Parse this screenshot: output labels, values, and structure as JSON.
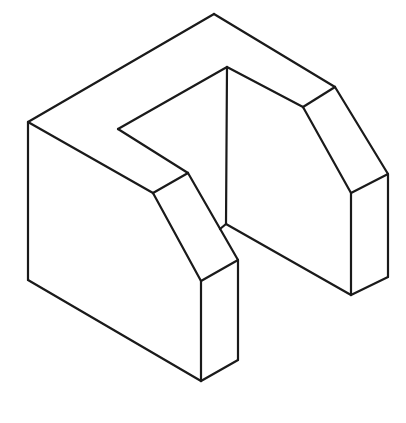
{
  "figure": {
    "title": "",
    "stroke_color": "#1a1a1a",
    "background_color": "#ffffff",
    "width": 406,
    "height": 423
  },
  "edges": [
    {
      "name": "top-left-edge",
      "points": "28,122 214,14"
    },
    {
      "name": "top-right-edge",
      "points": "214,14 335,87"
    },
    {
      "name": "left-vertical-edge",
      "points": "28,122 28,280"
    },
    {
      "name": "left-bottom-edge",
      "points": "28,280 201,381"
    },
    {
      "name": "left-top-front-edge",
      "points": "28,122 153,193"
    },
    {
      "name": "left-chamfer-top",
      "points": "153,193 188,173"
    },
    {
      "name": "left-chamfer-outer",
      "points": "153,193 201,281"
    },
    {
      "name": "left-chamfer-inner",
      "points": "188,173 238,260"
    },
    {
      "name": "left-post-top",
      "points": "201,281 238,260"
    },
    {
      "name": "left-post-front-vertical",
      "points": "201,281 201,381"
    },
    {
      "name": "left-post-right-vertical",
      "points": "238,260 238,360"
    },
    {
      "name": "left-post-bottom",
      "points": "201,381 238,360"
    },
    {
      "name": "notch-front-edge",
      "points": "188,173 118,129"
    },
    {
      "name": "notch-back-edge",
      "points": "118,129 227,67"
    },
    {
      "name": "slot-back-vertical",
      "points": "227,67 226,224"
    },
    {
      "name": "slot-floor-junction",
      "points": "220,229 226,224"
    },
    {
      "name": "slot-right-top-edge",
      "points": "227,67 303,107"
    },
    {
      "name": "slot-floor-right",
      "points": "226,224 351,295"
    },
    {
      "name": "right-chamfer-top",
      "points": "303,107 335,87"
    },
    {
      "name": "right-chamfer-inner",
      "points": "303,107 351,193"
    },
    {
      "name": "right-chamfer-outer",
      "points": "335,87 388,174"
    },
    {
      "name": "right-post-top",
      "points": "351,193 388,174"
    },
    {
      "name": "right-post-front-vertical",
      "points": "351,193 351,295"
    },
    {
      "name": "right-post-right-vertical",
      "points": "388,174 388,277"
    },
    {
      "name": "right-post-bottom",
      "points": "351,295 388,277"
    }
  ]
}
